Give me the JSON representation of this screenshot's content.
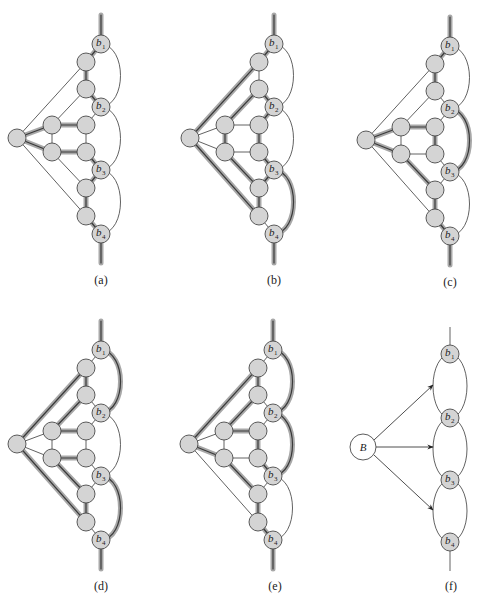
{
  "figure": {
    "node_fill": "#d4d4d4",
    "node_stroke": "#4a4a4a",
    "highlight_color": "#a8a8a8",
    "base_layout": {
      "nodes": {
        "c": [
          17,
          138
        ],
        "t1": [
          86,
          62
        ],
        "t2": [
          86,
          89
        ],
        "L1": [
          52,
          125
        ],
        "R1": [
          86,
          125
        ],
        "L2": [
          52,
          152
        ],
        "R2": [
          86,
          152
        ],
        "d1": [
          86,
          188
        ],
        "d2": [
          86,
          216
        ],
        "b1": [
          101,
          44
        ],
        "b2": [
          101,
          107
        ],
        "b3": [
          101,
          170
        ],
        "b4": [
          101,
          234
        ]
      },
      "node_radius": 9,
      "b_radius": 9,
      "top_stub": [
        [
          101,
          15
        ],
        [
          101,
          35
        ]
      ],
      "bottom_stub": [
        [
          101,
          243
        ],
        [
          101,
          263
        ]
      ],
      "edges": [
        [
          "c",
          "t1"
        ],
        [
          "c",
          "L1"
        ],
        [
          "c",
          "L2"
        ],
        [
          "c",
          "d2"
        ],
        [
          "L1",
          "t2"
        ],
        [
          "L1",
          "R1"
        ],
        [
          "L1",
          "L2"
        ],
        [
          "R1",
          "R2"
        ],
        [
          "L2",
          "R2"
        ],
        [
          "L2",
          "d1"
        ],
        [
          "t1",
          "t2"
        ],
        [
          "d1",
          "d2"
        ],
        [
          "b1",
          "t1"
        ],
        [
          "t2",
          "b2"
        ],
        [
          "b2",
          "R1"
        ],
        [
          "R2",
          "b3"
        ],
        [
          "b3",
          "d1"
        ],
        [
          "d2",
          "b4"
        ]
      ],
      "arcs": [
        [
          "b1",
          "b2"
        ],
        [
          "b2",
          "b3"
        ],
        [
          "b3",
          "b4"
        ]
      ]
    },
    "panels": [
      {
        "id": "a",
        "label": "(a)",
        "dx": 0,
        "dy": 0,
        "label_pos": [
          101,
          284
        ],
        "thick_edges": [
          [
            "c",
            "L1"
          ],
          [
            "c",
            "L2"
          ],
          [
            "L1",
            "R1"
          ],
          [
            "L2",
            "R2"
          ],
          [
            "t1",
            "t2"
          ],
          [
            "d1",
            "d2"
          ],
          [
            "b1",
            "t1"
          ],
          [
            "t2",
            "b2"
          ],
          [
            "R2",
            "b3"
          ],
          [
            "b3",
            "d1"
          ],
          [
            "d2",
            "b4"
          ]
        ],
        "thick_arcs": [],
        "thick_stubs": true
      },
      {
        "id": "b",
        "label": "(b)",
        "dx": 173,
        "dy": 0,
        "label_pos": [
          274,
          284
        ],
        "thick_edges": [
          [
            "c",
            "t1"
          ],
          [
            "c",
            "d2"
          ],
          [
            "L1",
            "t2"
          ],
          [
            "L2",
            "d1"
          ],
          [
            "L1",
            "L2"
          ],
          [
            "R1",
            "R2"
          ],
          [
            "t2",
            "b2"
          ],
          [
            "b2",
            "R1"
          ],
          [
            "R2",
            "b3"
          ],
          [
            "b3",
            "d1"
          ],
          [
            "d1",
            "d2"
          ],
          [
            "b1",
            "t1"
          ]
        ],
        "thick_arcs": [
          [
            "b3",
            "b4"
          ]
        ],
        "thick_stubs": true
      },
      {
        "id": "c",
        "label": "(c)",
        "dx": 349,
        "dy": 2,
        "label_pos": [
          450,
          286
        ],
        "thick_edges": [
          [
            "c",
            "L1"
          ],
          [
            "c",
            "L2"
          ],
          [
            "L1",
            "R1"
          ],
          [
            "R1",
            "R2"
          ],
          [
            "L2",
            "d1"
          ],
          [
            "d1",
            "d2"
          ],
          [
            "d2",
            "b4"
          ],
          [
            "t1",
            "t2"
          ],
          [
            "b1",
            "t1"
          ]
        ],
        "thick_arcs": [
          [
            "b2",
            "b3"
          ]
        ],
        "thick_stubs": true
      },
      {
        "id": "d",
        "label": "(d)",
        "dx": 0,
        "dy": 306,
        "label_pos": [
          101,
          590
        ],
        "thick_edges": [
          [
            "c",
            "t1"
          ],
          [
            "c",
            "d2"
          ],
          [
            "L1",
            "t2"
          ],
          [
            "L1",
            "R1"
          ],
          [
            "L2",
            "R2"
          ],
          [
            "L2",
            "d1"
          ],
          [
            "t1",
            "t2"
          ],
          [
            "d1",
            "d2"
          ]
        ],
        "thick_arcs": [
          [
            "b1",
            "b2"
          ],
          [
            "b3",
            "b4"
          ]
        ],
        "thick_stubs": true
      },
      {
        "id": "e",
        "label": "(e)",
        "dx": 172,
        "dy": 306,
        "label_pos": [
          275,
          590
        ],
        "thick_edges": [
          [
            "c",
            "t1"
          ],
          [
            "c",
            "L2"
          ],
          [
            "L1",
            "t2"
          ],
          [
            "L1",
            "R1"
          ],
          [
            "R1",
            "R2"
          ],
          [
            "L2",
            "d1"
          ],
          [
            "R2",
            "b3"
          ],
          [
            "t1",
            "t2"
          ],
          [
            "d1",
            "d2"
          ],
          [
            "d2",
            "b4"
          ]
        ],
        "thick_arcs": [
          [
            "b1",
            "b2"
          ],
          [
            "b2",
            "b3"
          ]
        ],
        "thick_stubs": true
      }
    ],
    "panel_f": {
      "id": "f",
      "label": "(f)",
      "label_pos": [
        451,
        590
      ],
      "B": {
        "label": "B",
        "pos": [
          363,
          447
        ],
        "r": 13
      },
      "b_nodes": [
        {
          "name": "b1",
          "sub": "1",
          "pos": [
            450,
            354
          ]
        },
        {
          "name": "b2",
          "sub": "2",
          "pos": [
            450,
            418
          ]
        },
        {
          "name": "b3",
          "sub": "3",
          "pos": [
            450,
            480
          ]
        },
        {
          "name": "b4",
          "sub": "4",
          "pos": [
            450,
            542
          ]
        }
      ],
      "b_radius": 9,
      "top_stub": [
        [
          450,
          327
        ],
        [
          450,
          345
        ]
      ],
      "bottom_stub": [
        [
          450,
          551
        ],
        [
          450,
          571
        ]
      ],
      "ellipse_rx": 17,
      "arrows": [
        {
          "from": [
            374,
            440
          ],
          "to": [
            433,
            385
          ]
        },
        {
          "from": [
            376,
            447
          ],
          "to": [
            433,
            447
          ]
        },
        {
          "from": [
            374,
            455
          ],
          "to": [
            433,
            510
          ]
        }
      ]
    },
    "b_labels": [
      {
        "letter": "b",
        "sub": "1"
      },
      {
        "letter": "b",
        "sub": "2"
      },
      {
        "letter": "b",
        "sub": "3"
      },
      {
        "letter": "b",
        "sub": "4"
      }
    ]
  }
}
